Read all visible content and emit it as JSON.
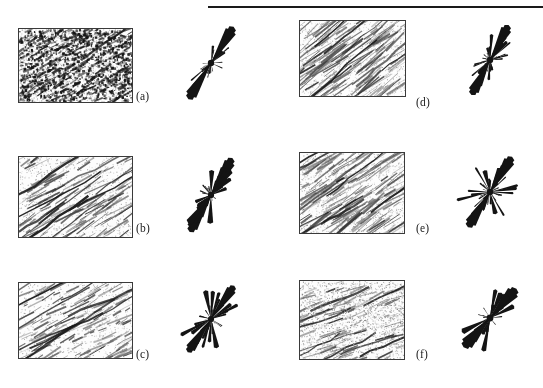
{
  "figure": {
    "width": 543,
    "height": 388,
    "background": "#ffffff",
    "ink_color": "#1a1a1a",
    "top_rule": {
      "x": 208,
      "y": 6,
      "width": 335,
      "height": 2
    },
    "captions": [
      {
        "label": "(a)",
        "x": 136,
        "y": 90
      },
      {
        "label": "(b)",
        "x": 136,
        "y": 222
      },
      {
        "label": "(c)",
        "x": 136,
        "y": 348
      },
      {
        "label": "(d)",
        "x": 416,
        "y": 96
      },
      {
        "label": "(e)",
        "x": 416,
        "y": 222
      },
      {
        "label": "(f)",
        "x": 416,
        "y": 348
      }
    ],
    "panels": [
      {
        "id": "a",
        "image": {
          "x": 18,
          "y": 28,
          "width": 113,
          "height": 73,
          "style": "dense-speckle",
          "seed": 11,
          "density": 0.62,
          "streak_angle": -30,
          "grain": 0.9
        },
        "rose": {
          "x": 168,
          "y": 20,
          "width": 86,
          "height": 86,
          "seed": 101,
          "mean_angle": -58,
          "spread": 14,
          "lobes": 8,
          "thickness": 1.0
        }
      },
      {
        "id": "b",
        "image": {
          "x": 18,
          "y": 156,
          "width": 113,
          "height": 80,
          "style": "sparse-lines",
          "seed": 22,
          "density": 0.26,
          "streak_angle": -32,
          "grain": 0.45
        },
        "rose": {
          "x": 168,
          "y": 150,
          "width": 86,
          "height": 90,
          "seed": 202,
          "mean_angle": -60,
          "spread": 18,
          "lobes": 10,
          "thickness": 0.95
        }
      },
      {
        "id": "c",
        "image": {
          "x": 18,
          "y": 282,
          "width": 113,
          "height": 75,
          "style": "sparse-lines",
          "seed": 33,
          "density": 0.22,
          "streak_angle": -28,
          "grain": 0.4
        },
        "rose": {
          "x": 168,
          "y": 278,
          "width": 86,
          "height": 82,
          "seed": 303,
          "mean_angle": -55,
          "spread": 22,
          "lobes": 14,
          "thickness": 0.9
        }
      },
      {
        "id": "d",
        "image": {
          "x": 299,
          "y": 20,
          "width": 105,
          "height": 75,
          "style": "long-streaks",
          "seed": 44,
          "density": 0.3,
          "streak_angle": -38,
          "grain": 0.6
        },
        "rose": {
          "x": 447,
          "y": 20,
          "width": 86,
          "height": 80,
          "seed": 404,
          "mean_angle": -62,
          "spread": 26,
          "lobes": 12,
          "thickness": 1.0
        }
      },
      {
        "id": "e",
        "image": {
          "x": 299,
          "y": 152,
          "width": 104,
          "height": 80,
          "style": "long-streaks",
          "seed": 55,
          "density": 0.28,
          "streak_angle": -34,
          "grain": 0.65
        },
        "rose": {
          "x": 447,
          "y": 150,
          "width": 86,
          "height": 84,
          "seed": 505,
          "mean_angle": -58,
          "spread": 30,
          "lobes": 12,
          "thickness": 1.0
        }
      },
      {
        "id": "f",
        "image": {
          "x": 299,
          "y": 280,
          "width": 104,
          "height": 78,
          "style": "soft-cloud",
          "seed": 66,
          "density": 0.24,
          "streak_angle": -22,
          "grain": 0.55
        },
        "rose": {
          "x": 447,
          "y": 278,
          "width": 86,
          "height": 80,
          "seed": 606,
          "mean_angle": -48,
          "spread": 16,
          "lobes": 7,
          "thickness": 1.2
        }
      }
    ]
  }
}
